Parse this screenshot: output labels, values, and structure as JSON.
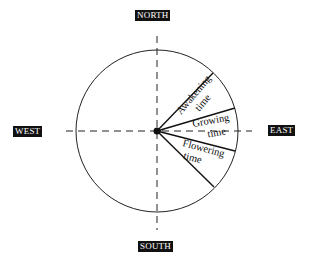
{
  "compass": {
    "north": "NORTH",
    "south": "SOUTH",
    "east": "EAST",
    "west": "WEST"
  },
  "segments": [
    {
      "line1": "Awakening",
      "line2": "time"
    },
    {
      "line1": "Growing",
      "line2": "time"
    },
    {
      "line1": "Flowering",
      "line2": "time"
    }
  ],
  "colors": {
    "ink": "#111111",
    "background": "#ffffff"
  }
}
